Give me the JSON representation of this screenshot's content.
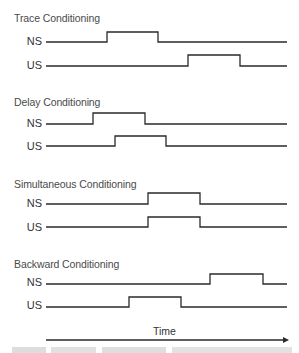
{
  "panels": [
    {
      "title": "Trace Conditioning",
      "signals": [
        {
          "label": "NS",
          "pulse": [
            107,
            158
          ]
        },
        {
          "label": "US",
          "pulse": [
            188,
            240
          ]
        }
      ]
    },
    {
      "title": "Delay Conditioning",
      "signals": [
        {
          "label": "NS",
          "pulse": [
            93,
            145
          ]
        },
        {
          "label": "US",
          "pulse": [
            115,
            166
          ]
        }
      ]
    },
    {
      "title": "Simultaneous Conditioning",
      "signals": [
        {
          "label": "NS",
          "pulse": [
            148,
            200
          ]
        },
        {
          "label": "US",
          "pulse": [
            148,
            200
          ]
        }
      ]
    },
    {
      "title": "Backward Conditioning",
      "signals": [
        {
          "label": "NS",
          "pulse": [
            210,
            263
          ]
        },
        {
          "label": "US",
          "pulse": [
            129,
            181
          ]
        }
      ]
    }
  ],
  "axis": {
    "label": "Time"
  },
  "colors": {
    "line": "#2a2a2a",
    "text": "#3a3a3a"
  }
}
